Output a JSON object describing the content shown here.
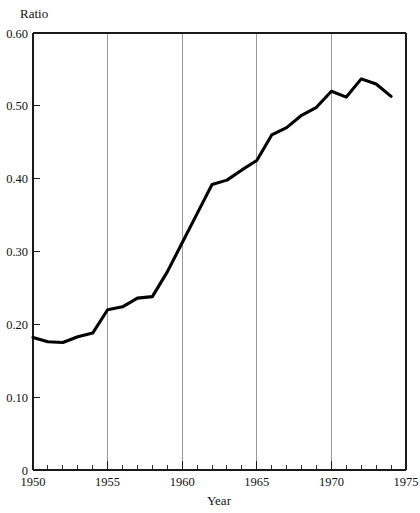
{
  "chart_data": {
    "type": "line",
    "title": "",
    "xlabel": "Year",
    "ylabel": "Ratio",
    "xlim": [
      1950,
      1975
    ],
    "ylim": [
      0,
      0.6
    ],
    "grid": "vertical-gridlines-at-major-x-ticks",
    "legend": "none",
    "x_major_ticks": [
      1950,
      1955,
      1960,
      1965,
      1970,
      1975
    ],
    "x_major_tick_labels": [
      "1950",
      "1955",
      "1960",
      "1965",
      "1970",
      "1975"
    ],
    "x_minor_tick_step": 1,
    "y_ticks": [
      0,
      0.1,
      0.2,
      0.3,
      0.4,
      0.5,
      0.6
    ],
    "y_tick_labels": [
      "0",
      "0.10",
      "0.20",
      "0.30",
      "0.40",
      "0.50",
      "0.60"
    ],
    "gridline_years": [
      1955,
      1960,
      1965,
      1970
    ],
    "series": [
      {
        "name": "Ratio",
        "color": "#000000",
        "x": [
          1950,
          1951,
          1952,
          1953,
          1954,
          1955,
          1956,
          1957,
          1958,
          1959,
          1960,
          1961,
          1962,
          1963,
          1964,
          1965,
          1966,
          1967,
          1968,
          1969,
          1970,
          1971,
          1972,
          1973,
          1974
        ],
        "values": [
          0.182,
          0.176,
          0.175,
          0.183,
          0.188,
          0.22,
          0.224,
          0.236,
          0.238,
          0.272,
          0.312,
          0.352,
          0.392,
          0.398,
          0.412,
          0.425,
          0.46,
          0.47,
          0.487,
          0.498,
          0.52,
          0.512,
          0.537,
          0.53,
          0.513
        ]
      }
    ]
  },
  "axes": {
    "y_title": "Ratio",
    "x_title": "Year"
  }
}
